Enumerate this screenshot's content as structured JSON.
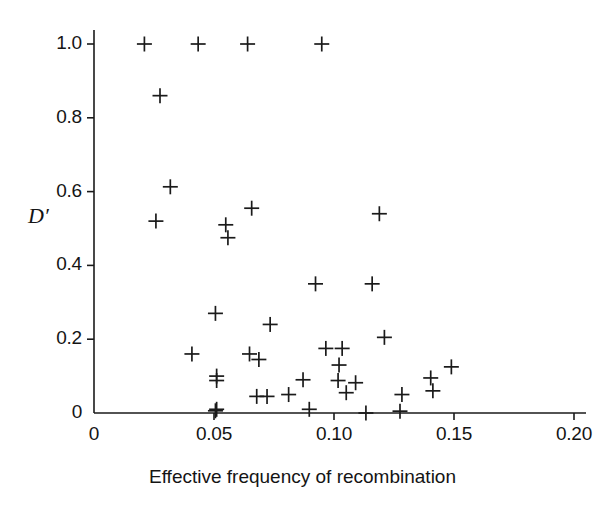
{
  "figure": {
    "background_color": "#ffffff",
    "axis_color": "#1a1a1a",
    "marker_color": "#1a1a1a",
    "marker_symbol": "plus"
  },
  "chart_data": {
    "type": "scatter",
    "title": "",
    "xlabel": "Effective frequency of recombination",
    "ylabel": "D′",
    "xlim": [
      0,
      0.2
    ],
    "ylim": [
      0,
      1.05
    ],
    "grid": false,
    "legend": null,
    "xticks": [
      0,
      0.05,
      0.1,
      0.15,
      0.2
    ],
    "xtick_labels": [
      "0",
      "0.05",
      "0.10",
      "0.15",
      "0.20"
    ],
    "yticks": [
      0,
      0.2,
      0.4,
      0.6,
      0.8,
      1.0
    ],
    "ytick_labels": [
      "0",
      "0.2",
      "0.4",
      "0.6",
      "0.8",
      "1.0"
    ],
    "marker": "+",
    "n_points": 47,
    "points": [
      {
        "x": 0.021,
        "y": 1.0
      },
      {
        "x": 0.0434,
        "y": 1.0
      },
      {
        "x": 0.064,
        "y": 1.0
      },
      {
        "x": 0.0949,
        "y": 1.0
      },
      {
        "x": 0.0275,
        "y": 0.86
      },
      {
        "x": 0.0318,
        "y": 0.613
      },
      {
        "x": 0.0258,
        "y": 0.52
      },
      {
        "x": 0.0657,
        "y": 0.555
      },
      {
        "x": 0.0549,
        "y": 0.51
      },
      {
        "x": 0.0558,
        "y": 0.475
      },
      {
        "x": 0.1189,
        "y": 0.54
      },
      {
        "x": 0.0923,
        "y": 0.35
      },
      {
        "x": 0.1159,
        "y": 0.35
      },
      {
        "x": 0.0506,
        "y": 0.27
      },
      {
        "x": 0.0734,
        "y": 0.24
      },
      {
        "x": 0.121,
        "y": 0.205
      },
      {
        "x": 0.0408,
        "y": 0.16
      },
      {
        "x": 0.0648,
        "y": 0.16
      },
      {
        "x": 0.0687,
        "y": 0.145
      },
      {
        "x": 0.0966,
        "y": 0.175
      },
      {
        "x": 0.1034,
        "y": 0.175
      },
      {
        "x": 0.1021,
        "y": 0.13
      },
      {
        "x": 0.1403,
        "y": 0.095
      },
      {
        "x": 0.1489,
        "y": 0.125
      },
      {
        "x": 0.1412,
        "y": 0.06
      },
      {
        "x": 0.0511,
        "y": 0.1
      },
      {
        "x": 0.0511,
        "y": 0.088
      },
      {
        "x": 0.0871,
        "y": 0.09
      },
      {
        "x": 0.1017,
        "y": 0.088
      },
      {
        "x": 0.109,
        "y": 0.082
      },
      {
        "x": 0.1051,
        "y": 0.055
      },
      {
        "x": 0.1283,
        "y": 0.05
      },
      {
        "x": 0.0678,
        "y": 0.045
      },
      {
        "x": 0.0721,
        "y": 0.045
      },
      {
        "x": 0.0811,
        "y": 0.05
      },
      {
        "x": 0.0511,
        "y": 0.01
      },
      {
        "x": 0.0897,
        "y": 0.01
      },
      {
        "x": 0.1133,
        "y": 0.0
      },
      {
        "x": 0.1275,
        "y": 0.005
      },
      {
        "x": 0.0506,
        "y": 0.006
      }
    ]
  }
}
